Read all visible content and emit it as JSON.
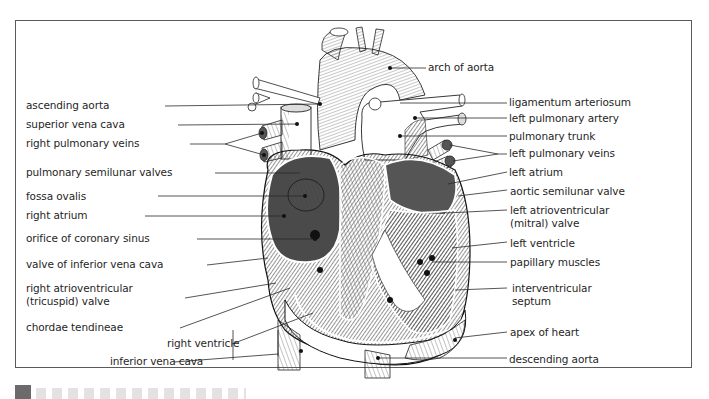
{
  "figure": {
    "labels_left": [
      {
        "id": "ascending-aorta",
        "text": "ascending aorta",
        "x": 89,
        "y": 100
      },
      {
        "id": "superior-vena-cava",
        "text": "superior vena cava",
        "x": 89,
        "y": 119
      },
      {
        "id": "right-pulmonary-veins",
        "text": "right pulmonary veins",
        "x": 89,
        "y": 138
      },
      {
        "id": "pulmonary-semilunar-valves",
        "text": "pulmonary semilunar valves",
        "x": 89,
        "y": 167
      },
      {
        "id": "fossa-ovalis",
        "text": "fossa ovalis",
        "x": 89,
        "y": 191
      },
      {
        "id": "right-atrium",
        "text": "right atrium",
        "x": 89,
        "y": 210
      },
      {
        "id": "orifice-of-coronary-sinus",
        "text": "orifice of coronary sinus",
        "x": 89,
        "y": 233
      },
      {
        "id": "valve-of-inferior-vena-cava",
        "text": "valve of inferior vena cava",
        "x": 89,
        "y": 259
      },
      {
        "id": "right-atrioventricular-valve",
        "text": "right atrioventricular",
        "text2": "(tricuspid) valve",
        "x": 89,
        "y": 283
      },
      {
        "id": "chordae-tendineae",
        "text": "chordae tendineae",
        "x": 89,
        "y": 322
      },
      {
        "id": "right-ventricle",
        "text": "right ventricle",
        "x": 167,
        "y": 338
      },
      {
        "id": "inferior-vena-cava",
        "text": "inferior vena cava",
        "x": 110,
        "y": 356
      }
    ],
    "labels_right": [
      {
        "id": "arch-of-aorta",
        "text": "arch of aorta",
        "x": 428,
        "y": 62
      },
      {
        "id": "ligamentum-arteriosum",
        "text": "ligamentum arteriosum",
        "x": 509,
        "y": 97
      },
      {
        "id": "left-pulmonary-artery",
        "text": "left pulmonary artery",
        "x": 509,
        "y": 113
      },
      {
        "id": "pulmonary-trunk",
        "text": "pulmonary trunk",
        "x": 509,
        "y": 131
      },
      {
        "id": "left-pulmonary-veins",
        "text": "left pulmonary veins",
        "x": 509,
        "y": 148
      },
      {
        "id": "left-atrium",
        "text": "left atrium",
        "x": 509,
        "y": 167
      },
      {
        "id": "aortic-semilunar-valve",
        "text": "aortic semilunar valve",
        "x": 510,
        "y": 186
      },
      {
        "id": "left-atrioventricular-valve",
        "text": "left atrioventricular",
        "text2": "(mitral) valve",
        "x": 510,
        "y": 205
      },
      {
        "id": "left-ventricle",
        "text": "left ventricle",
        "x": 510,
        "y": 238
      },
      {
        "id": "papillary-muscles",
        "text": "papillary muscles",
        "x": 510,
        "y": 257
      },
      {
        "id": "interventricular-septum",
        "text": "interventricular",
        "text2": "septum",
        "x": 512,
        "y": 283
      },
      {
        "id": "apex-of-heart",
        "text": "apex of heart",
        "x": 510,
        "y": 327
      },
      {
        "id": "descending-aorta",
        "text": "descending aorta",
        "x": 509,
        "y": 354
      }
    ]
  },
  "colors": {
    "frame_border": "#5a5a5a",
    "ink": "#1f1f1f",
    "tissue_dark": "#3c3c3c",
    "tissue_mid": "#7a7a7a",
    "tissue_light": "#bdbdbd",
    "caption_marker": "#6b6b6b"
  }
}
